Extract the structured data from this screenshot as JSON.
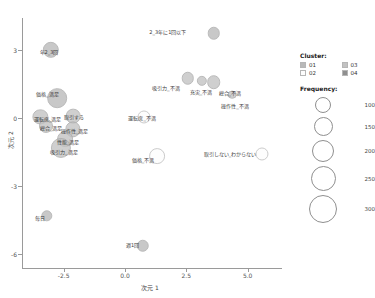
{
  "chart_data": {
    "type": "scatter",
    "title": "",
    "xlabel": "次元 1",
    "ylabel": "次元 2",
    "xlim": [
      -4.2,
      6.4
    ],
    "ylim": [
      -6.6,
      4.4
    ],
    "xticks": [
      "-2.5",
      "0.0",
      "2.5",
      "5.0"
    ],
    "xtick_values": [
      -2.5,
      0.0,
      2.5,
      5.0
    ],
    "yticks": [
      "3",
      "0",
      "-3",
      "-6"
    ],
    "ytick_values": [
      3,
      0,
      -3,
      -6
    ],
    "grid": false,
    "size_encoding": "Frequency",
    "color_encoding": "Cluster",
    "points": [
      {
        "label": "2_3年に1回以下",
        "x": 3.62,
        "y": 3.72,
        "freq": 150,
        "cluster": "01",
        "label_dx": -46,
        "label_dy": -1
      },
      {
        "label": "年2_3回",
        "x": -3.02,
        "y": 3.0,
        "freq": 185,
        "cluster": "01",
        "label_dx": -2,
        "label_dy": 2
      },
      {
        "label": "吸引力_不満",
        "x": 2.56,
        "y": 1.74,
        "freq": 150,
        "cluster": "03",
        "label_dx": -22,
        "label_dy": 10
      },
      {
        "label": "充実_不満",
        "x": 3.14,
        "y": 1.62,
        "freq": 130,
        "cluster": "03",
        "label_dx": -1,
        "label_dy": 11
      },
      {
        "label": "総合_不満",
        "x": 3.62,
        "y": 1.58,
        "freq": 160,
        "cluster": "03",
        "label_dx": 16,
        "label_dy": 11
      },
      {
        "label": "操作性_不満",
        "x": 4.36,
        "y": 1.02,
        "freq": 115,
        "cluster": "03",
        "label_dx": 3,
        "label_dy": 11
      },
      {
        "label": "価格_満足",
        "x": -2.76,
        "y": 0.86,
        "freq": 215,
        "cluster": "01",
        "label_dx": -10,
        "label_dy": -4
      },
      {
        "label": "運転席_満足",
        "x": -3.45,
        "y": 0.06,
        "freq": 175,
        "cluster": "03",
        "label_dx": 7,
        "label_dy": 2
      },
      {
        "label": "取引する",
        "x": -2.12,
        "y": 0.08,
        "freq": 170,
        "cluster": "03",
        "label_dx": 1,
        "label_dy": 1
      },
      {
        "label": "総合_満足",
        "x": -3.22,
        "y": -0.34,
        "freq": 165,
        "cluster": "03",
        "label_dx": 5,
        "label_dy": 2
      },
      {
        "label": "操作性_満足",
        "x": -2.14,
        "y": -0.5,
        "freq": 175,
        "cluster": "03",
        "label_dx": 2,
        "label_dy": 2
      },
      {
        "label": "性能_満足",
        "x": -2.44,
        "y": -0.94,
        "freq": 180,
        "cluster": "03",
        "label_dx": 3,
        "label_dy": 3
      },
      {
        "label": "吸引力_満足",
        "x": -2.62,
        "y": -1.3,
        "freq": 220,
        "cluster": "03",
        "label_dx": 3,
        "label_dy": 4
      },
      {
        "label": "運転席_不満",
        "x": 0.78,
        "y": 0.04,
        "freq": 155,
        "cluster": "02",
        "label_dx": -2,
        "label_dy": 1
      },
      {
        "label": "価格_不満",
        "x": 1.3,
        "y": -1.66,
        "freq": 180,
        "cluster": "02",
        "label_dx": -14,
        "label_dy": 4
      },
      {
        "label": "取引しない_わからない",
        "x": 5.58,
        "y": -1.6,
        "freq": 155,
        "cluster": "02",
        "label_dx": -32,
        "label_dy": 0
      },
      {
        "label": "毎日",
        "x": -3.2,
        "y": -4.3,
        "freq": 140,
        "cluster": "01",
        "label_dx": -7,
        "label_dy": 2
      },
      {
        "label": "週1回",
        "x": 0.72,
        "y": -5.62,
        "freq": 150,
        "cluster": "01",
        "label_dx": -10,
        "label_dy": -1
      }
    ]
  },
  "legend": {
    "cluster_title": "Cluster:",
    "cluster_items": [
      {
        "label": "01",
        "color": "#b9b9b9"
      },
      {
        "label": "02",
        "color": "#fdfdfd"
      },
      {
        "label": "03",
        "color": "#c2c2c2"
      },
      {
        "label": "04",
        "color": "#8f8f8f"
      }
    ],
    "frequency_title": "Frequency:",
    "frequency_items": [
      {
        "label": "100",
        "size": 16
      },
      {
        "label": "150",
        "size": 19
      },
      {
        "label": "200",
        "size": 22
      },
      {
        "label": "250",
        "size": 25
      },
      {
        "label": "300",
        "size": 28
      }
    ]
  }
}
